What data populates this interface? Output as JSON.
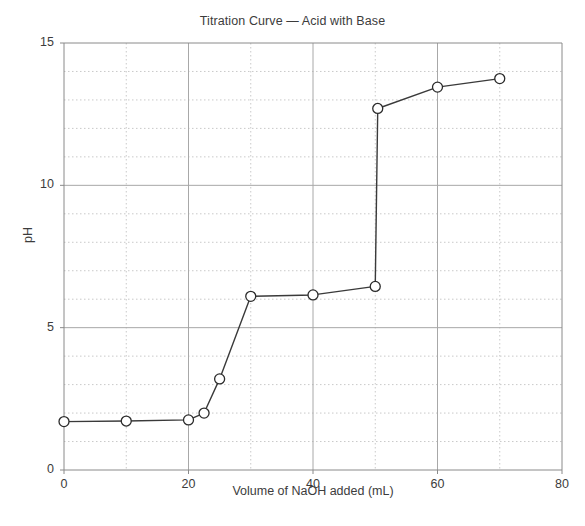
{
  "chart_data": {
    "type": "line",
    "title": "Titration Curve — Acid with Base",
    "xlabel": "Volume of NaOH added (mL)",
    "ylabel": "pH",
    "xlim": [
      0,
      80
    ],
    "ylim": [
      0,
      15
    ],
    "x_major_ticks": [
      0,
      20,
      40,
      60,
      80
    ],
    "x_minor_gridlines": [
      10,
      30,
      50,
      70
    ],
    "y_major_ticks": [
      0,
      5,
      10,
      15
    ],
    "y_minor_gridlines": [
      1,
      2,
      3,
      4,
      6,
      7,
      8,
      9,
      11,
      12,
      13,
      14
    ],
    "x_tick_labels": [
      "0",
      "20",
      "40",
      "60",
      "80"
    ],
    "y_tick_labels": [
      "0",
      "5",
      "10",
      "15"
    ],
    "grid": true,
    "legend": false,
    "marker": "open-circle",
    "line_color": "#3a3a3a",
    "marker_edge_color": "#2b2b2b",
    "marker_face_color": "#ffffff",
    "grid_major_color": "#a8a8a8",
    "grid_minor_color": "#c9c9c9",
    "x": [
      0,
      10,
      20,
      22.5,
      25,
      30,
      40,
      50,
      50.4,
      60,
      70
    ],
    "y": [
      1.7,
      1.72,
      1.76,
      2.0,
      3.2,
      6.1,
      6.15,
      6.45,
      12.7,
      13.45,
      13.75
    ],
    "series": [
      {
        "name": "pH",
        "points": [
          {
            "x": 0,
            "y": 1.7
          },
          {
            "x": 10,
            "y": 1.72
          },
          {
            "x": 20,
            "y": 1.76
          },
          {
            "x": 22.5,
            "y": 2.0
          },
          {
            "x": 25,
            "y": 3.2
          },
          {
            "x": 30,
            "y": 6.1
          },
          {
            "x": 40,
            "y": 6.15
          },
          {
            "x": 50,
            "y": 6.45
          },
          {
            "x": 50.4,
            "y": 12.7
          },
          {
            "x": 60,
            "y": 13.45
          },
          {
            "x": 70,
            "y": 13.75
          }
        ]
      }
    ]
  }
}
